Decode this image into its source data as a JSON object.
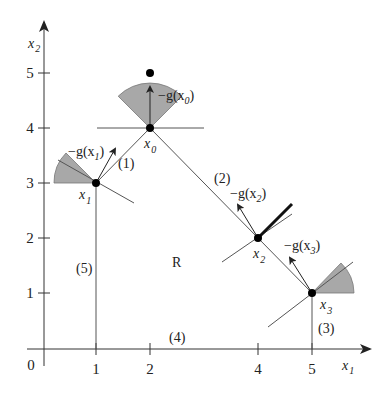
{
  "diagram": {
    "type": "feasible-direction-optimization-plot",
    "axes": {
      "x_label": "x",
      "x_label_sub": "1",
      "y_label": "x",
      "y_label_sub": "2",
      "origin_label": "0",
      "x_ticks": [
        "1",
        "2",
        "4",
        "5"
      ],
      "y_ticks": [
        "1",
        "2",
        "3",
        "4",
        "5"
      ]
    },
    "points": {
      "x0": {
        "name": "x",
        "sub": "0",
        "coord": [
          2,
          4
        ]
      },
      "x1": {
        "name": "x",
        "sub": "1",
        "coord": [
          1,
          3
        ]
      },
      "x2": {
        "name": "x",
        "sub": "2",
        "coord": [
          4,
          2
        ]
      },
      "x3": {
        "name": "x",
        "sub": "3",
        "coord": [
          5,
          1
        ]
      },
      "extra_dot": {
        "coord": [
          2,
          5
        ]
      }
    },
    "gradients": {
      "g0": {
        "prefix": "−g(x",
        "sub": "0",
        "suffix": ")"
      },
      "g1": {
        "prefix": "−g(x",
        "sub": "1",
        "suffix": ")"
      },
      "g2": {
        "prefix": "−g(x",
        "sub": "2",
        "suffix": ")"
      },
      "g3": {
        "prefix": "−g(x",
        "sub": "3",
        "suffix": ")"
      }
    },
    "constraints": {
      "c1": "(1)",
      "c2": "(2)",
      "c3": "(3)",
      "c4": "(4)",
      "c5": "(5)"
    },
    "region_label": "R",
    "colors": {
      "wedge_fill": "#a8a8a8",
      "line": "#555555",
      "axis": "#333333",
      "point": "#000000"
    }
  }
}
